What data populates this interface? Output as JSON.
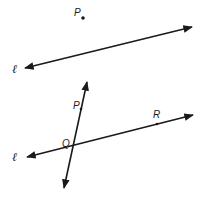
{
  "diagram": {
    "figure1": {
      "point_label": "P",
      "line_label": "ℓ"
    },
    "figure2": {
      "point_p_label": "P",
      "point_q_label": "Q",
      "point_r_label": "R",
      "line_label": "ℓ"
    },
    "colors": {
      "stroke": "#1a1a1a",
      "background": "#ffffff"
    }
  }
}
